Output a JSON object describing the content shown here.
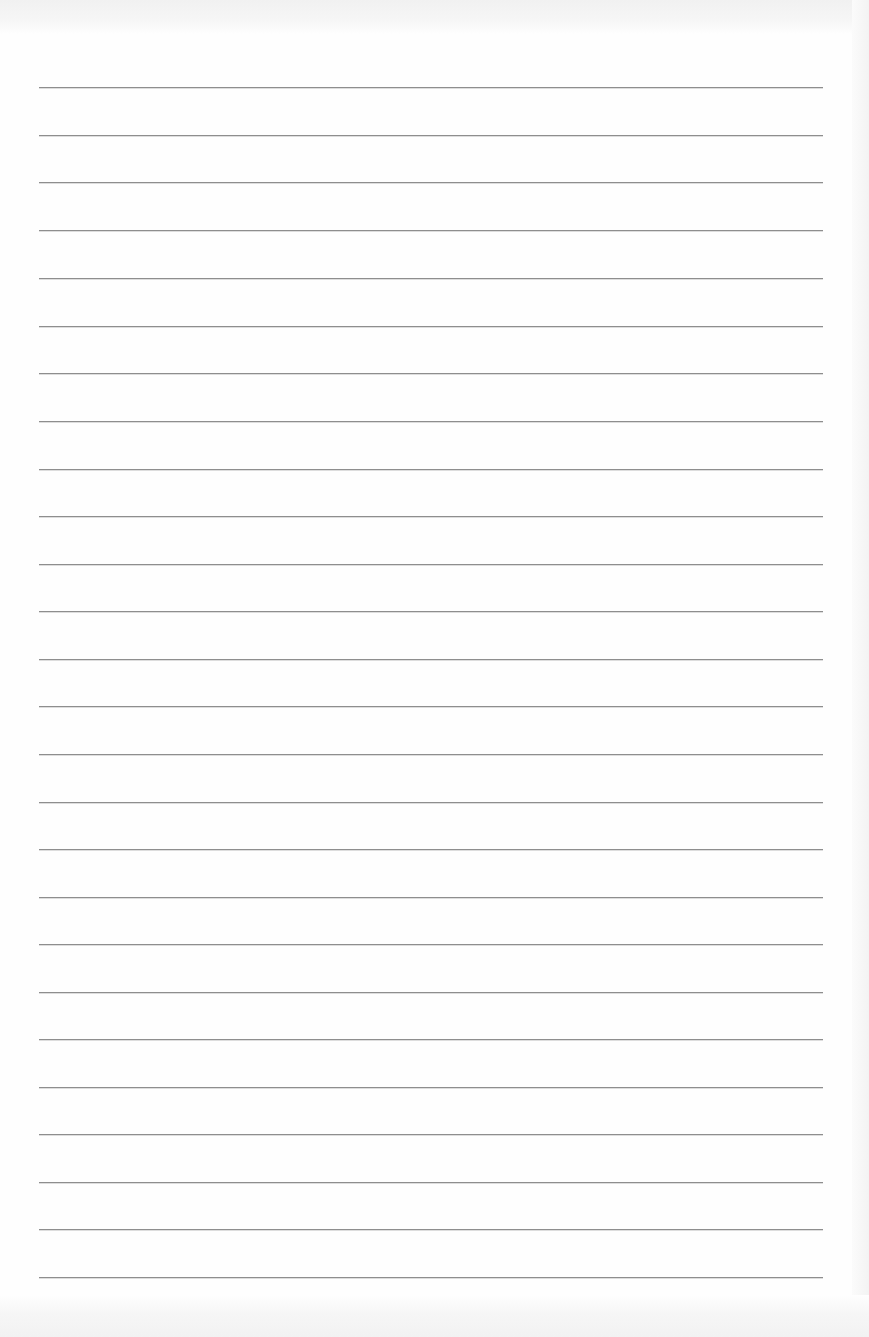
{
  "document": {
    "type": "blank lined paper",
    "line_count": 26,
    "line_color": "#8e8e8e",
    "background_color": "#fefefe",
    "lines": [
      {
        "y": 87
      },
      {
        "y": 135
      },
      {
        "y": 182
      },
      {
        "y": 230
      },
      {
        "y": 278
      },
      {
        "y": 326
      },
      {
        "y": 373
      },
      {
        "y": 421
      },
      {
        "y": 469
      },
      {
        "y": 516
      },
      {
        "y": 564
      },
      {
        "y": 611
      },
      {
        "y": 659
      },
      {
        "y": 706
      },
      {
        "y": 754
      },
      {
        "y": 802
      },
      {
        "y": 849
      },
      {
        "y": 897
      },
      {
        "y": 944
      },
      {
        "y": 992
      },
      {
        "y": 1039
      },
      {
        "y": 1087
      },
      {
        "y": 1134
      },
      {
        "y": 1182
      },
      {
        "y": 1229
      },
      {
        "y": 1277
      }
    ]
  }
}
